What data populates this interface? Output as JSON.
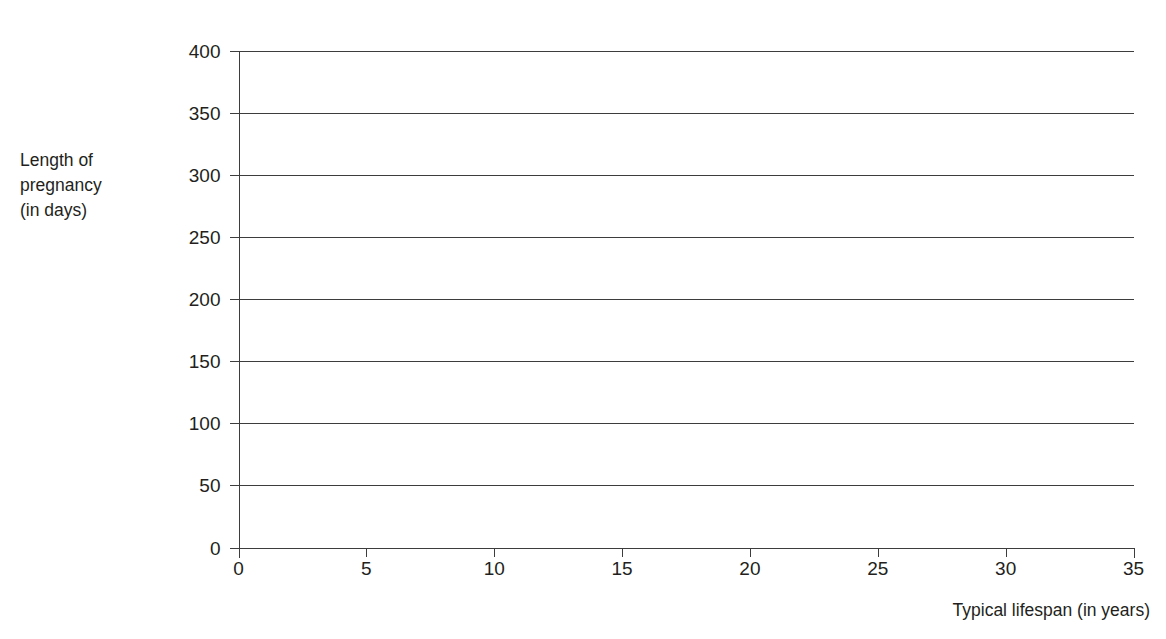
{
  "page": {
    "background_color": "#ffffff",
    "ink_color": "#231f20",
    "line_color": "#3d3d3d",
    "width": 1166,
    "height": 639
  },
  "title": {
    "text": "",
    "note_cropped": "title is cut off above the top edge of the screenshot"
  },
  "axis": {
    "y_caption_lines": [
      "Length of",
      "pregnancy",
      "(in days)"
    ],
    "x_caption": "Typical lifespan (in years)"
  },
  "chart_data": {
    "type": "scatter",
    "title": "",
    "xlabel": "Typical lifespan (in years)",
    "ylabel": "Length of pregnancy (in days)",
    "xlim": [
      0,
      35
    ],
    "ylim": [
      0,
      400
    ],
    "xticks": [
      0,
      5,
      10,
      15,
      20,
      25,
      30,
      35
    ],
    "yticks": [
      0,
      50,
      100,
      150,
      200,
      250,
      300,
      350,
      400
    ],
    "xtick_labels": [
      "0",
      "5",
      "10",
      "15",
      "20",
      "25",
      "30",
      "35"
    ],
    "ytick_labels": [
      "0",
      "50",
      "100",
      "150",
      "200",
      "250",
      "300",
      "350",
      "400"
    ],
    "grid": "horizontal",
    "grid_on": true,
    "legend": null,
    "legend_position": "none",
    "series": [],
    "x": [],
    "values": [],
    "annotations": [],
    "note": "Empty plotting area - axes and horizontal gridlines only, no data points drawn"
  }
}
